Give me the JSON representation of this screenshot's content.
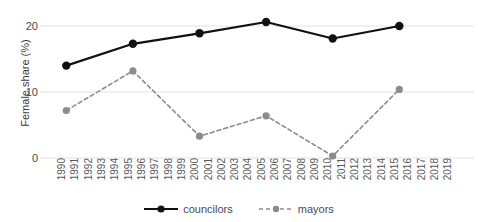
{
  "chart_data": {
    "type": "line",
    "title": "",
    "subtitle": "",
    "xlabel": "",
    "ylabel": "Female share (%)",
    "x": [
      1990,
      1991,
      1992,
      1993,
      1994,
      1995,
      1996,
      1997,
      1998,
      1999,
      2000,
      2001,
      2002,
      2003,
      2004,
      2005,
      2006,
      2007,
      2008,
      2009,
      2010,
      2011,
      2012,
      2013,
      2014,
      2015,
      2016,
      2017,
      2018,
      2019
    ],
    "xtick_labels": [
      "1990",
      "1991",
      "1992",
      "1993",
      "1994",
      "1995",
      "1996",
      "1997",
      "1998",
      "1999",
      "2000",
      "2001",
      "2002",
      "2003",
      "2004",
      "2005",
      "2006",
      "2007",
      "2008",
      "2009",
      "2010",
      "2011",
      "2012",
      "2013",
      "2014",
      "2015",
      "2016",
      "2017",
      "2018",
      "2019"
    ],
    "ytick_labels": [
      "0",
      "10",
      "20"
    ],
    "ytick_values": [
      0,
      10,
      20
    ],
    "ylim": [
      0,
      22
    ],
    "xlim": [
      1990,
      2019
    ],
    "grid": "horizontal",
    "legend_position": "bottom-center",
    "series": [
      {
        "name": "councilors",
        "style": "solid",
        "color": "#111111",
        "marker": "circle",
        "points": [
          {
            "x": 1991,
            "y": 14.0
          },
          {
            "x": 1996,
            "y": 17.3
          },
          {
            "x": 2001,
            "y": 18.9
          },
          {
            "x": 2006,
            "y": 20.6
          },
          {
            "x": 2011,
            "y": 18.1
          },
          {
            "x": 2016,
            "y": 20.0
          }
        ]
      },
      {
        "name": "mayors",
        "style": "dashed",
        "color": "#8c8c8c",
        "marker": "circle",
        "points": [
          {
            "x": 1991,
            "y": 7.2
          },
          {
            "x": 1996,
            "y": 13.2
          },
          {
            "x": 2001,
            "y": 3.3
          },
          {
            "x": 2006,
            "y": 6.4
          },
          {
            "x": 2011,
            "y": 0.3
          },
          {
            "x": 2016,
            "y": 10.4
          }
        ]
      }
    ]
  },
  "legend": {
    "items": [
      {
        "label": "councilors"
      },
      {
        "label": "mayors"
      }
    ]
  },
  "colors": {
    "councilors": "#111111",
    "mayors": "#8c8c8c",
    "grid": "#e2e2e2",
    "text": "#4a4a4a",
    "background": "#ffffff"
  }
}
